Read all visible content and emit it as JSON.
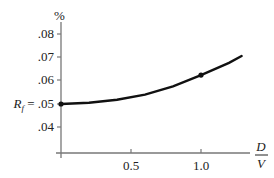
{
  "chart_data": {
    "type": "line",
    "title": "",
    "xlabel": "D/V",
    "xlabel_num": "D",
    "xlabel_den": "V",
    "ylabel": "%",
    "y_ticks": [
      ".04",
      ".05",
      ".06",
      ".07",
      ".08"
    ],
    "y_tick_values": [
      0.04,
      0.05,
      0.06,
      0.07,
      0.08
    ],
    "x_ticks": [
      "0.5",
      "1.0"
    ],
    "x_tick_values": [
      0.5,
      1.0
    ],
    "xlim": [
      0,
      1.35
    ],
    "ylim": [
      0.03,
      0.085
    ],
    "grid": false,
    "annotations": [
      {
        "text": "R_f = .05",
        "label_main": "R",
        "label_sub": "f",
        "label_eq": " = .05",
        "x": 0,
        "y": 0.05
      }
    ],
    "series": [
      {
        "name": "curve",
        "x": [
          0,
          0.2,
          0.4,
          0.6,
          0.8,
          1.0,
          1.2,
          1.29
        ],
        "values": [
          0.05,
          0.0505,
          0.0518,
          0.054,
          0.0576,
          0.0624,
          0.0677,
          0.0706
        ]
      }
    ],
    "marked_points": [
      {
        "x": 0,
        "y": 0.05
      },
      {
        "x": 1.0,
        "y": 0.0624
      }
    ]
  },
  "colors": {
    "axis": "#777777",
    "curve": "#111111",
    "text": "#222222"
  }
}
